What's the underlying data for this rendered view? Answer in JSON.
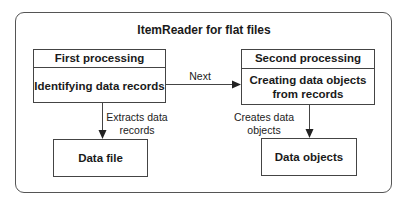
{
  "diagram": {
    "title": "ItemReader for flat files",
    "first_box": {
      "header": "First processing",
      "body": "Identifying data records"
    },
    "second_box": {
      "header": "Second processing",
      "body_line1": "Creating data objects",
      "body_line2": "from records"
    },
    "data_file_box": {
      "label": "Data file"
    },
    "data_objects_box": {
      "label": "Data objects"
    },
    "arrows": {
      "next": "Next",
      "extracts_line1": "Extracts data",
      "extracts_line2": "records",
      "creates_line1": "Creates data",
      "creates_line2": "objects"
    },
    "colors": {
      "line": "#444444",
      "background": "#ffffff",
      "text": "#1a1a1a"
    }
  }
}
